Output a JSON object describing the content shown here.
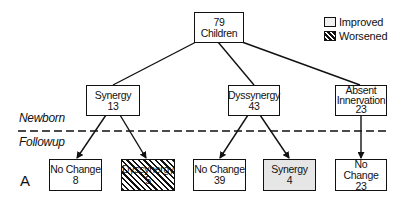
{
  "legend": {
    "improved": "Improved",
    "worsened": "Worsened"
  },
  "phases": {
    "newborn": "Newborn",
    "followup": "Followup"
  },
  "panel_label": "A",
  "root": {
    "count": "79",
    "label": "Children"
  },
  "newborn_nodes": [
    {
      "label": "Synergy",
      "count": "13"
    },
    {
      "label": "Dyssynergy",
      "count": "43"
    },
    {
      "label": "Absent Innervation",
      "line1": "Absent",
      "line2": "Innervation",
      "count": "23"
    }
  ],
  "followup_nodes": [
    {
      "label": "No Change",
      "count": "8",
      "status": "unchanged",
      "parent": "Synergy"
    },
    {
      "label": "Dyssynergy",
      "count": "5",
      "status": "worsened",
      "parent": "Synergy"
    },
    {
      "label": "No Change",
      "count": "39",
      "status": "unchanged",
      "parent": "Dyssynergy"
    },
    {
      "label": "Synergy",
      "count": "4",
      "status": "improved",
      "parent": "Dyssynergy"
    },
    {
      "label": "No Change",
      "count": "23",
      "status": "unchanged",
      "parent": "Absent Innervation"
    }
  ]
}
